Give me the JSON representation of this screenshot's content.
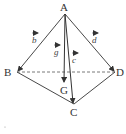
{
  "diagram": {
    "type": "tetrahedron-vectors",
    "vertices": {
      "A": {
        "label": "A",
        "x": 65,
        "y": 13
      },
      "B": {
        "label": "B",
        "x": 17,
        "y": 72
      },
      "C": {
        "label": "C",
        "x": 74,
        "y": 104
      },
      "D": {
        "label": "D",
        "x": 115,
        "y": 72
      },
      "G": {
        "label": "G",
        "x": 64,
        "y": 83
      }
    },
    "vectors": [
      {
        "name": "b",
        "label": "b",
        "from": "A",
        "to": "B"
      },
      {
        "name": "c",
        "label": "c",
        "from": "A",
        "to": "C"
      },
      {
        "name": "d",
        "label": "d",
        "from": "A",
        "to": "D"
      },
      {
        "name": "g",
        "label": "g",
        "from": "A",
        "to": "G"
      }
    ],
    "dashed_edges": [
      [
        "B",
        "D"
      ]
    ],
    "solid_edges": [
      [
        "B",
        "C"
      ],
      [
        "C",
        "D"
      ]
    ],
    "colors": {
      "line": "#333333",
      "text": "#333333"
    }
  }
}
